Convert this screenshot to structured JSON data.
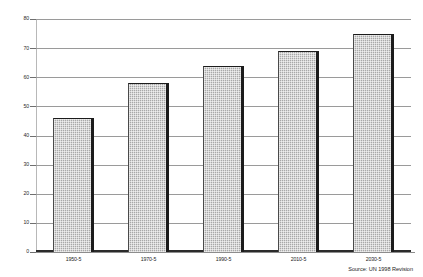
{
  "chart_data": {
    "type": "bar",
    "title": "",
    "subtitle": "",
    "xlabel": "",
    "ylabel": "",
    "categories": [
      "1950-5",
      "1970-5",
      "1990-5",
      "2010-5",
      "2030-5"
    ],
    "values": [
      46,
      58,
      64,
      69,
      75
    ],
    "series": [
      {
        "name": "",
        "values": [
          46,
          58,
          64,
          69,
          75
        ]
      }
    ],
    "ylim": [
      0,
      80
    ],
    "yticks": [
      0,
      10,
      20,
      30,
      40,
      50,
      60,
      70,
      80
    ],
    "ytick_labels": [
      "0",
      "10",
      "20",
      "30",
      "40",
      "50",
      "60",
      "70",
      "80"
    ],
    "xtick_labels": [
      "1950-5",
      "1970-5",
      "1990-5",
      "2010-5",
      "2030-5"
    ],
    "grid": true,
    "grid_axis": "y",
    "legend": false,
    "legend_position": "none",
    "bar_color": "#a8a8a8",
    "bar_edge_color": "#1c1c1c",
    "grid_color": "#9a9a9a",
    "axis_color": "#2b2b2b",
    "annotations": [
      {
        "name": "source-note",
        "text": "Source: UN 1998 Revision",
        "position": "bottom-right"
      }
    ]
  },
  "footer": {
    "source": "Source: UN 1998 Revision"
  }
}
